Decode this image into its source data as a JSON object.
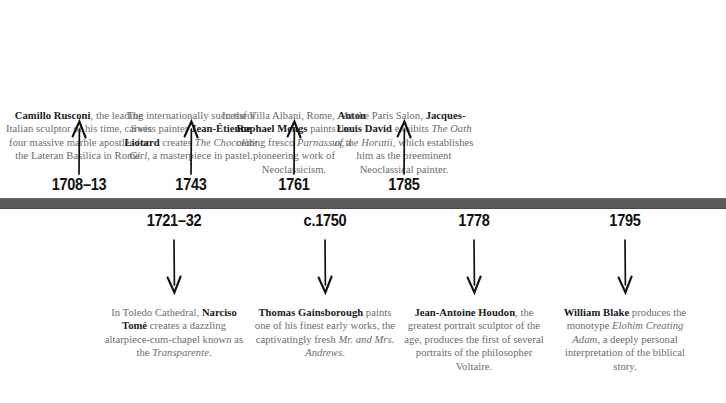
{
  "figure": {
    "type": "timeline",
    "orientation": "horizontal",
    "bar_color": "#595959",
    "text_color": "#6b6b6b",
    "name_color": "#1a1a1a",
    "year_color": "#111111"
  },
  "events_above": [
    {
      "year": "1708–13",
      "arrow": "arrow-up",
      "text_html": "<b>Camillo Rusconi</b>, the leading Italian sculptor of his time, carves four massive marble apostles for the Lateran Basilica in Rome.",
      "person": "Camillo Rusconi"
    },
    {
      "year": "1743",
      "arrow": "arrow-up",
      "text_html": "The internationally successful Swiss painter <b>Jean-Étienne Liotard</b> creates <i>The Chocolate Girl</i>, a masterpiece in pastel.",
      "person": "Jean-Étienne Liotard"
    },
    {
      "year": "1761",
      "arrow": "arrow-up",
      "text_html": "In the Villa Albani, Rome, <b>Anton Raphael Mengs</b> paints the ceiling fresco <i>Parnassus</i>, a pioneering work of Neoclassicism.",
      "person": "Anton Raphael Mengs"
    },
    {
      "year": "1785",
      "arrow": "arrow-up",
      "text_html": "At the Paris Salon, <b>Jacques-Louis David</b> exhibits <i>The Oath of the Horatii</i>, which establishes him as the preeminent Neoclassical painter.",
      "person": "Jacques-Louis David"
    }
  ],
  "events_below": [
    {
      "year": "1721–32",
      "arrow": "arrow-down",
      "text_html": "In Toledo Cathedral, <b>Narciso Tomé</b> creates a dazzling altarpiece-cum-chapel known as the <i>Transparente</i>.",
      "person": "Narciso Tomé"
    },
    {
      "year": "c.1750",
      "arrow": "arrow-down",
      "text_html": "<b>Thomas Gainsborough</b> paints one of his finest early works, the captivatingly fresh <i>Mr. and Mrs. Andrews</i>.",
      "person": "Thomas Gainsborough"
    },
    {
      "year": "1778",
      "arrow": "arrow-down",
      "text_html": "<b>Jean-Antoine Houdon</b>, the greatest portrait sculptor of the age, produces the first of several portraits of the philosopher Voltaire.",
      "person": "Jean-Antoine Houdon"
    },
    {
      "year": "1795",
      "arrow": "arrow-down",
      "text_html": "<b>William Blake</b> produces the monotype <i>Elohim Creating Adam</i>, a deeply personal interpretation of the biblical story.",
      "person": "William Blake"
    }
  ]
}
